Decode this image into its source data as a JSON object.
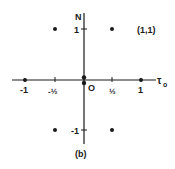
{
  "figure": {
    "caption": "(b)",
    "x_axis_label": "τ",
    "x_axis_subscript": "o",
    "y_axis_label": "N",
    "origin_label": "O",
    "point_annotation": "(1,1)",
    "x_ticks": [
      {
        "value": -1,
        "label": "-1",
        "px": 25
      },
      {
        "value": -0.5,
        "label": "-½",
        "px": 55
      },
      {
        "value": 0.5,
        "label": "½",
        "px": 112
      },
      {
        "value": 1,
        "label": "1",
        "px": 141
      }
    ],
    "y_ticks": [
      {
        "value": 1,
        "label": "1",
        "py": 29
      },
      {
        "value": -1,
        "label": "-1",
        "py": 130
      }
    ],
    "points": [
      {
        "x": -0.5,
        "y": 1
      },
      {
        "x": 0.5,
        "y": 1
      },
      {
        "x": -0.5,
        "y": -1
      },
      {
        "x": 0.5,
        "y": -1
      },
      {
        "x": -1,
        "y": 0
      },
      {
        "x": 1,
        "y": 0
      },
      {
        "x": 0,
        "y": 0.06
      },
      {
        "x": 0,
        "y": -0.06
      }
    ],
    "colors": {
      "ink": "#1a1a1a",
      "background": "#ffffff"
    }
  }
}
